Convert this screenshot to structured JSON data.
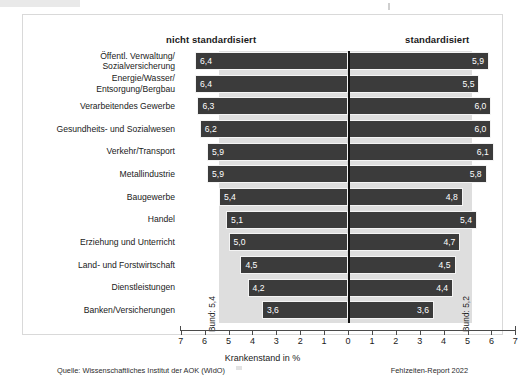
{
  "headers": {
    "left": "nicht standardisiert",
    "right": "standardisiert"
  },
  "annotations": {
    "bund_left": "Bund: 5,4",
    "bund_right": "Bund: 5,2"
  },
  "footer": {
    "source": "Quelle: Wissenschaftliches Institut der AOK (WIdO)",
    "report": "Fehlzeiten-Report 2022"
  },
  "chart_data": {
    "type": "bar",
    "orientation": "horizontal-diverging",
    "title": "",
    "xlabel": "Krankenstand in %",
    "ylabel": "",
    "xlim": [
      -7,
      7
    ],
    "xticks": [
      7,
      6,
      5,
      4,
      3,
      2,
      1,
      0,
      1,
      2,
      3,
      4,
      5,
      6,
      7
    ],
    "tick_labels": [
      "7",
      "6",
      "5",
      "4",
      "3",
      "2",
      "1",
      "0",
      "1",
      "2",
      "3",
      "4",
      "5",
      "6",
      "7"
    ],
    "grid": false,
    "legend_position": "top",
    "categories": [
      "Öffentl. Verwaltung/\nSozialversicherung",
      "Energie/Wasser/\nEntsorgung/Bergbau",
      "Verarbeitendes Gewerbe",
      "Gesundheits- und Sozialwesen",
      "Verkehr/Transport",
      "Metallindustrie",
      "Baugewerbe",
      "Handel",
      "Erziehung und Unterricht",
      "Land- und Forstwirtschaft",
      "Dienstleistungen",
      "Banken/Versicherungen"
    ],
    "series": [
      {
        "name": "nicht standardisiert",
        "side": "left",
        "values": [
          6.4,
          6.4,
          6.3,
          6.2,
          5.9,
          5.9,
          5.4,
          5.1,
          5.0,
          4.5,
          4.2,
          3.6
        ],
        "labels": [
          "6,4",
          "6,4",
          "6,3",
          "6,2",
          "5,9",
          "5,9",
          "5,4",
          "5,1",
          "5,0",
          "4,5",
          "4,2",
          "3,6"
        ],
        "reference": 5.4,
        "reference_label": "Bund: 5,4"
      },
      {
        "name": "standardisiert",
        "side": "right",
        "values": [
          5.9,
          5.5,
          6.0,
          6.0,
          6.1,
          5.8,
          4.8,
          5.4,
          4.7,
          4.5,
          4.4,
          3.6
        ],
        "labels": [
          "5,9",
          "5,5",
          "6,0",
          "6,0",
          "6,1",
          "5,8",
          "4,8",
          "5,4",
          "4,7",
          "4,5",
          "4,4",
          "3,6"
        ],
        "reference": 5.2,
        "reference_label": "Bund: 5,2"
      }
    ],
    "colors": {
      "bar": "#3b3b3b",
      "band": "#dedede",
      "axis": "#4a4a4a",
      "text": "#1a1a1a"
    }
  }
}
